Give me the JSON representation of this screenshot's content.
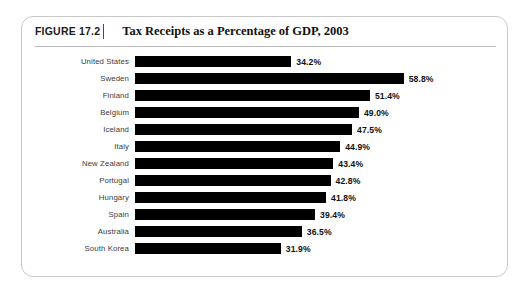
{
  "figure": {
    "number_label": "FIGURE 17.2",
    "title": "Tax Receipts as a Percentage of GDP, 2003"
  },
  "chart_data": {
    "type": "bar",
    "orientation": "horizontal",
    "title": "Tax Receipts as a Percentage of GDP, 2003",
    "xlabel": "",
    "ylabel": "",
    "xlim": [
      0,
      58.8
    ],
    "grid": false,
    "legend": null,
    "categories": [
      "United States",
      "Sweden",
      "Finland",
      "Belgium",
      "Iceland",
      "Italy",
      "New Zealand",
      "Portugal",
      "Hungary",
      "Spain",
      "Australia",
      "South Korea"
    ],
    "values": [
      34.2,
      58.8,
      51.4,
      49.0,
      47.5,
      44.9,
      43.4,
      42.8,
      41.8,
      39.4,
      36.5,
      31.9
    ],
    "data_labels": [
      "34.2%",
      "58.8%",
      "51.4%",
      "49.0%",
      "47.5%",
      "44.9%",
      "43.4%",
      "42.8%",
      "41.8%",
      "39.4%",
      "36.5%",
      "31.9%"
    ],
    "bar_color": "#000000"
  }
}
